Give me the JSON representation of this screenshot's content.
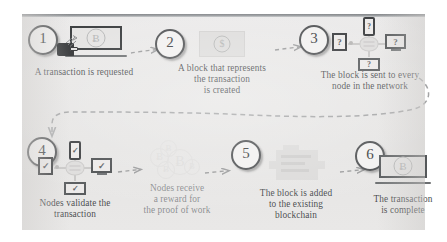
{
  "diagram": {
    "background_color": "#e8e7e6",
    "accent_color": "#4f5153",
    "step_count": 6
  },
  "steps": [
    {
      "number": "1",
      "caption": "A transaction is requested",
      "icon": "laptop-with-bitcoin-and-hand-icon",
      "icon_symbol": "Ƀ"
    },
    {
      "number": "2",
      "caption": "A block that represents\nthe transaction\nis created",
      "icon": "block-bill-icon",
      "icon_symbol": "$"
    },
    {
      "number": "3",
      "caption": "The block is sent to every\nnode in the network",
      "icon": "node-network-icon",
      "node_glyph": "?",
      "nodes": [
        "phone",
        "tablet-left",
        "monitor-right",
        "tablet-bottom"
      ]
    },
    {
      "number": "4",
      "caption": "Nodes validate the\ntransaction",
      "icon": "node-network-validated-icon",
      "node_glyph": "✓",
      "nodes": [
        "phone",
        "tablet-left",
        "monitor-right",
        "tablet-bottom"
      ]
    },
    {
      "number": "5",
      "caption": "Nodes receive\na reward for\nthe proof of work",
      "icon": "bitcoin-coins-cluster-icon",
      "icon_symbol": "Ƀ"
    },
    {
      "number": "6",
      "caption": "The block is added\nto the existing\nblockchain",
      "icon": "blockchain-block-icon"
    },
    {
      "number": "7",
      "caption": "The transaction\nis complete",
      "icon": "laptop-complete-icon",
      "icon_symbol": "Ƀ"
    }
  ],
  "labels": {
    "badge_1": "1",
    "badge_2": "2",
    "badge_3": "3",
    "badge_4": "4",
    "badge_5": "5",
    "badge_6": "6",
    "cap_1": "A transaction is requested",
    "cap_2": "A block that represents\nthe transaction\nis created",
    "cap_3": "The block is sent to every\nnode in the network",
    "cap_4": "Nodes validate the\ntransaction",
    "cap_5": "Nodes receive\na reward for\nthe proof of work",
    "cap_6": "The block is added\nto the existing\nblockchain",
    "cap_7": "The transaction\nis complete",
    "bitcoin_symbol": "Ƀ",
    "dollar_symbol": "$",
    "question_glyph": "?",
    "check_glyph": "✓"
  },
  "arrows": [
    {
      "name": "arrow-step1-to-step2",
      "style": "dashed",
      "direction": "right"
    },
    {
      "name": "arrow-step2-to-step3",
      "style": "dashed",
      "direction": "right"
    },
    {
      "name": "arrow-step3-to-step4",
      "style": "dashed",
      "direction": "wrap-around-left-down"
    },
    {
      "name": "arrow-step4-to-step5",
      "style": "dashed",
      "direction": "right"
    },
    {
      "name": "arrow-step5-to-step6",
      "style": "dashed",
      "direction": "right"
    },
    {
      "name": "arrow-step6-to-step7",
      "style": "dashed",
      "direction": "right"
    }
  ]
}
